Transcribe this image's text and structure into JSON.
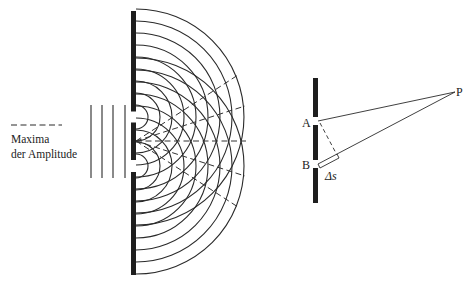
{
  "colors": {
    "ink": "#2a2a2a",
    "barrier": "#1e1e1e",
    "background": "#ffffff"
  },
  "legend": {
    "symbol": "dashed-line",
    "line1": "Maxima",
    "line2": "der Amplitude"
  },
  "left_diagram": {
    "description": "Double-slit interference of plane waves",
    "barrier": {
      "x": 131,
      "width": 5,
      "y_top": 11,
      "y_bottom": 275
    },
    "slits": [
      {
        "y_center": 117,
        "gap": 11
      },
      {
        "y_center": 166,
        "gap": 12
      }
    ],
    "incident_wavefronts_x": [
      91,
      102,
      113,
      125
    ],
    "incident_y_range": [
      105,
      178
    ],
    "arc_spacing": 12,
    "arc_count": 9,
    "maxima_origin": {
      "x": 136,
      "y": 141
    },
    "maxima_endpoints": [
      {
        "x": 238,
        "y": 75
      },
      {
        "x": 245,
        "y": 106
      },
      {
        "x": 246,
        "y": 141
      },
      {
        "x": 245,
        "y": 176
      },
      {
        "x": 238,
        "y": 207
      }
    ]
  },
  "right_diagram": {
    "description": "Path difference geometry",
    "barrier": {
      "x": 313,
      "width": 5,
      "y_top": 78,
      "y_bottom": 203
    },
    "points": {
      "A": {
        "label": "A",
        "x": 318,
        "y": 121
      },
      "B": {
        "label": "B",
        "x": 318,
        "y": 163
      },
      "P": {
        "label": "P",
        "x": 455,
        "y": 92
      }
    },
    "path_difference_label": "Δs"
  }
}
